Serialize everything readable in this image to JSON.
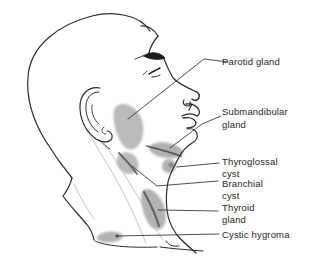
{
  "figure": {
    "labels": [
      {
        "id": "parotid",
        "lines": [
          "Parotid gland"
        ]
      },
      {
        "id": "submandibular",
        "lines": [
          "Submandibular",
          "gland"
        ]
      },
      {
        "id": "thyroglossal",
        "lines": [
          "Thyroglossal",
          "cyst"
        ]
      },
      {
        "id": "branchial",
        "lines": [
          "Branchial",
          "cyst"
        ]
      },
      {
        "id": "thyroid",
        "lines": [
          "Thyroid",
          "gland"
        ]
      },
      {
        "id": "cystic_hygroma",
        "lines": [
          "Cystic hygroma"
        ]
      }
    ],
    "colors": {
      "line": "#2b2b2b",
      "leader": "#3a3a3a",
      "shade": "#b0b0b0",
      "shade_dark": "#5a5a5a",
      "background": "#ffffff"
    }
  }
}
